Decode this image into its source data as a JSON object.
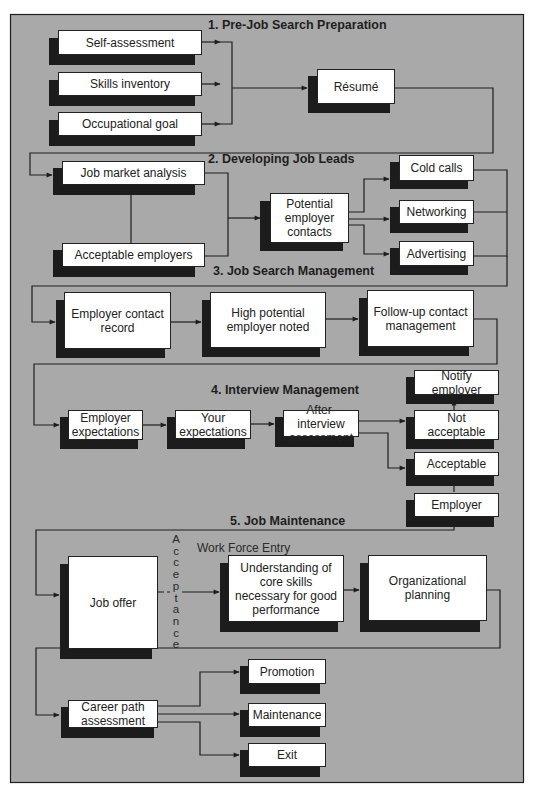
{
  "colors": {
    "panel_fill": "#a9a9a9",
    "box_fill": "#ffffff",
    "shadow": "#1c1c1c",
    "line": "#1e1e1e"
  },
  "sections": [
    {
      "id": 1,
      "title": "1. Pre-Job Search Preparation"
    },
    {
      "id": 2,
      "title": "2. Developing Job Leads"
    },
    {
      "id": 3,
      "title": "3. Job Search Management"
    },
    {
      "id": 4,
      "title": "4. Interview Management"
    },
    {
      "id": 5,
      "title": "5. Job Maintenance"
    }
  ],
  "nodes": {
    "self_assessment": "Self-assessment",
    "skills_inventory": "Skills inventory",
    "occupational_goal": "Occupational goal",
    "resume": "Résumé",
    "job_market_analysis": "Job market analysis",
    "acceptable_employers": "Acceptable employers",
    "potential_employer_contacts": "Potential employer contacts",
    "cold_calls": "Cold calls",
    "networking": "Networking",
    "advertising": "Advertising",
    "employer_contact_record": "Employer contact record",
    "high_potential_employer_noted": "High potential employer noted",
    "follow_up_contact_management": "Follow-up contact management",
    "notify_employer": "Notify employer",
    "employer_expectations": "Employer expectations",
    "your_expectations": "Your expectations",
    "after_interview_assessment": "After-interview assessment",
    "not_acceptable": "Not acceptable",
    "acceptable": "Acceptable",
    "employer": "Employer",
    "job_offer": "Job offer",
    "understanding_core_skills": "Understanding of core skills necessary for good performance",
    "organizational_planning": "Organizational planning",
    "career_path_assessment": "Career path assessment",
    "promotion": "Promotion",
    "maintenance": "Maintenance",
    "exit": "Exit"
  },
  "labels": {
    "acceptance": "A\nc\nc\ne\np\nt\na\nn\nc\ne",
    "work_force_entry": "Work Force Entry"
  },
  "edges": [
    [
      "self_assessment",
      "resume"
    ],
    [
      "skills_inventory",
      "resume"
    ],
    [
      "occupational_goal",
      "resume"
    ],
    [
      "resume",
      "job_market_analysis"
    ],
    [
      "job_market_analysis",
      "acceptable_employers"
    ],
    [
      "job_market_analysis",
      "potential_employer_contacts"
    ],
    [
      "acceptable_employers",
      "potential_employer_contacts"
    ],
    [
      "potential_employer_contacts",
      "cold_calls"
    ],
    [
      "potential_employer_contacts",
      "networking"
    ],
    [
      "potential_employer_contacts",
      "advertising"
    ],
    [
      "cold_calls",
      "employer_contact_record"
    ],
    [
      "networking",
      "employer_contact_record"
    ],
    [
      "advertising",
      "employer_contact_record"
    ],
    [
      "employer_contact_record",
      "high_potential_employer_noted"
    ],
    [
      "high_potential_employer_noted",
      "follow_up_contact_management"
    ],
    [
      "follow_up_contact_management",
      "employer_expectations"
    ],
    [
      "employer_expectations",
      "your_expectations"
    ],
    [
      "your_expectations",
      "after_interview_assessment"
    ],
    [
      "after_interview_assessment",
      "not_acceptable"
    ],
    [
      "after_interview_assessment",
      "acceptable"
    ],
    [
      "not_acceptable",
      "notify_employer"
    ],
    [
      "acceptable",
      "employer"
    ],
    [
      "employer",
      "job_offer"
    ],
    [
      "job_offer",
      "understanding_core_skills"
    ],
    [
      "understanding_core_skills",
      "organizational_planning"
    ],
    [
      "organizational_planning",
      "career_path_assessment"
    ],
    [
      "career_path_assessment",
      "promotion"
    ],
    [
      "career_path_assessment",
      "maintenance"
    ],
    [
      "career_path_assessment",
      "exit"
    ]
  ]
}
